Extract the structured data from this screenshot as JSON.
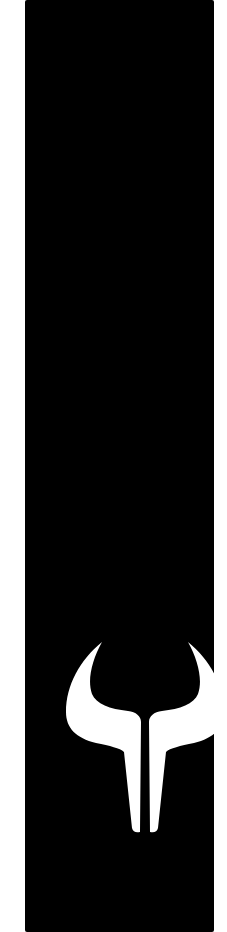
{
  "panel": {
    "background": "#000000",
    "logo": {
      "icon": "bull-horns-icon",
      "color": "#ffffff"
    }
  }
}
